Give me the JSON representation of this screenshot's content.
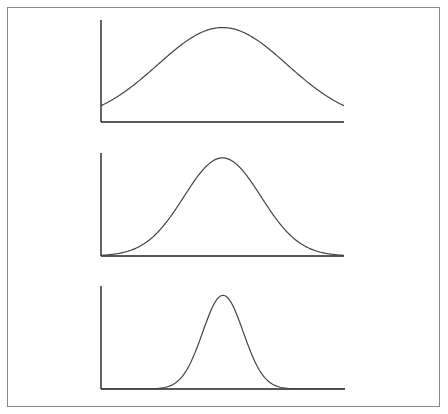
{
  "chart_data": [
    {
      "type": "line",
      "title": "",
      "xlabel": "",
      "ylabel": "",
      "description": "Wide bell curve (large standard deviation)",
      "distribution": "normal",
      "mean": 0,
      "std": 1.6,
      "xlim": [
        -3,
        3
      ],
      "ylim": [
        0,
        1.08
      ],
      "grid": false,
      "legend": "none"
    },
    {
      "type": "line",
      "title": "",
      "xlabel": "",
      "ylabel": "",
      "description": "Medium bell curve",
      "distribution": "normal",
      "mean": 0,
      "std": 0.95,
      "xlim": [
        -3,
        3
      ],
      "ylim": [
        0,
        1.05
      ],
      "grid": false,
      "legend": "none"
    },
    {
      "type": "line",
      "title": "",
      "xlabel": "",
      "ylabel": "",
      "description": "Narrow bell curve (small standard deviation)",
      "distribution": "normal",
      "mean": 0,
      "std": 0.5,
      "xlim": [
        -3,
        3
      ],
      "ylim": [
        0,
        1.1
      ],
      "grid": false,
      "legend": "none"
    }
  ],
  "colors": {
    "axis": "#222222",
    "curve": "#444444",
    "frame": "#8a8a8a"
  }
}
